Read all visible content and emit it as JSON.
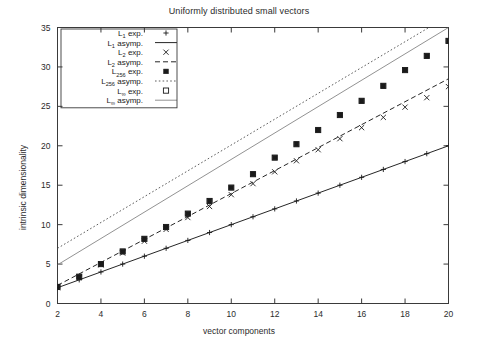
{
  "chart_data": {
    "type": "scatter",
    "title": "Uniformly distributed small vectors",
    "xlabel": "vector components",
    "ylabel": "intrinsic dimensionality",
    "xlim": [
      2,
      20
    ],
    "ylim": [
      0,
      35
    ],
    "xticks": [
      2,
      4,
      6,
      8,
      10,
      12,
      14,
      16,
      18,
      20
    ],
    "yticks": [
      0,
      5,
      10,
      15,
      20,
      25,
      30,
      35
    ],
    "grid": false,
    "legend_position": "top-left-inside",
    "x": [
      2,
      3,
      4,
      5,
      6,
      7,
      8,
      9,
      10,
      11,
      12,
      13,
      14,
      15,
      16,
      17,
      18,
      19,
      20
    ],
    "series": [
      {
        "name": "L_1 exp.",
        "label_base": "L",
        "label_sub": "1",
        "label_tail": " exp.",
        "kind": "points",
        "marker": "plus",
        "color": "#1a1a1a",
        "values": [
          2.0,
          3.0,
          4.0,
          5.0,
          6.0,
          7.0,
          8.0,
          9.0,
          10.0,
          11.0,
          12.0,
          13.0,
          14.0,
          15.0,
          16.0,
          17.0,
          18.0,
          19.0,
          20.0
        ]
      },
      {
        "name": "L_1 asymp.",
        "label_base": "L",
        "label_sub": "1",
        "label_tail": " asymp.",
        "kind": "line",
        "style": "solid",
        "color": "#1a1a1a",
        "endpoints": [
          [
            2,
            2.0
          ],
          [
            20,
            20.0
          ]
        ]
      },
      {
        "name": "L_2 exp.",
        "label_base": "L",
        "label_sub": "2",
        "label_tail": " exp.",
        "kind": "points",
        "marker": "cross",
        "color": "#1a1a1a",
        "values": [
          2.0,
          3.3,
          4.9,
          6.4,
          7.9,
          9.4,
          10.9,
          12.3,
          13.8,
          15.2,
          16.7,
          18.1,
          19.5,
          20.9,
          22.3,
          23.6,
          24.9,
          26.1,
          27.5
        ]
      },
      {
        "name": "L_2 asymp.",
        "label_base": "L",
        "label_sub": "2",
        "label_tail": " asymp.",
        "kind": "line",
        "style": "dashed",
        "color": "#1a1a1a",
        "endpoints": [
          [
            2,
            2.3
          ],
          [
            20,
            28.5
          ]
        ]
      },
      {
        "name": "L_256 exp.",
        "label_base": "L",
        "label_sub": "256",
        "label_tail": " exp.",
        "kind": "points",
        "marker": "filled-square",
        "color": "#1a1a1a",
        "values": [
          2.1,
          3.4,
          5.0,
          6.6,
          8.2,
          9.7,
          11.4,
          13.0,
          14.7,
          16.4,
          18.5,
          20.2,
          22.0,
          23.9,
          25.7,
          27.6,
          29.6,
          31.4,
          33.3
        ]
      },
      {
        "name": "L_256 asymp.",
        "label_base": "L",
        "label_sub": "256",
        "label_tail": " asymp.",
        "kind": "line",
        "style": "dotted",
        "color": "#555555",
        "endpoints": [
          [
            2,
            7.0
          ],
          [
            19.1,
            35.0
          ]
        ]
      },
      {
        "name": "L_inf exp.",
        "label_base": "L",
        "label_sub": "∞",
        "label_tail": " exp.",
        "kind": "points",
        "marker": "open-square",
        "color": "#1a1a1a",
        "values": [
          2.1,
          3.4,
          5.0,
          6.6,
          8.2,
          9.7,
          11.4,
          13.0,
          14.7,
          16.4,
          18.5,
          20.2,
          22.0,
          23.9,
          25.7,
          27.6,
          29.6,
          31.4,
          33.3
        ]
      },
      {
        "name": "L_inf asymp.",
        "label_base": "L",
        "label_sub": "∞",
        "label_tail": " asymp.",
        "kind": "line",
        "style": "solid",
        "color": "#8c8c8c",
        "endpoints": [
          [
            2,
            4.9
          ],
          [
            20,
            35.0
          ]
        ]
      }
    ]
  }
}
